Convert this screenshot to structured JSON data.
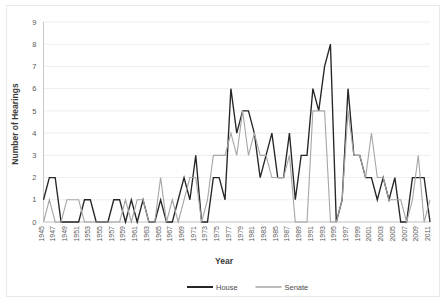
{
  "chart_data": {
    "type": "line",
    "title": "",
    "xlabel": "Year",
    "ylabel": "Number of Hearings",
    "ylim": [
      0,
      9
    ],
    "xlim": [
      1945,
      2011
    ],
    "grid": true,
    "legend_position": "bottom",
    "y_ticks": [
      "0",
      "1",
      "2",
      "3",
      "4",
      "5",
      "6",
      "7",
      "8",
      "9"
    ],
    "x_tick_labels": [
      "1945",
      "1947",
      "1949",
      "1951",
      "1953",
      "1955",
      "1957",
      "1959",
      "1961",
      "1963",
      "1965",
      "1967",
      "1969",
      "1971",
      "1973",
      "1975",
      "1977",
      "1979",
      "1981",
      "1983",
      "1985",
      "1987",
      "1989",
      "1991",
      "1993",
      "1995",
      "1997",
      "1999",
      "2001",
      "2003",
      "2005",
      "2007",
      "2009",
      "2011"
    ],
    "x": [
      1945,
      1946,
      1947,
      1948,
      1949,
      1950,
      1951,
      1952,
      1953,
      1954,
      1955,
      1956,
      1957,
      1958,
      1959,
      1960,
      1961,
      1962,
      1963,
      1964,
      1965,
      1966,
      1967,
      1968,
      1969,
      1970,
      1971,
      1972,
      1973,
      1974,
      1975,
      1976,
      1977,
      1978,
      1979,
      1980,
      1981,
      1982,
      1983,
      1984,
      1985,
      1986,
      1987,
      1988,
      1989,
      1990,
      1991,
      1992,
      1993,
      1994,
      1995,
      1996,
      1997,
      1998,
      1999,
      2000,
      2001,
      2002,
      2003,
      2004,
      2005,
      2006,
      2007,
      2008,
      2009,
      2010,
      2011
    ],
    "series": [
      {
        "name": "House",
        "color": "#262626",
        "values": [
          1,
          2,
          2,
          0,
          0,
          0,
          0,
          1,
          1,
          0,
          0,
          0,
          1,
          1,
          0,
          1,
          0,
          1,
          0,
          0,
          1,
          0,
          0,
          1,
          2,
          1,
          3,
          0,
          0,
          2,
          2,
          1,
          6,
          4,
          5,
          5,
          4,
          2,
          3,
          4,
          2,
          2,
          4,
          1,
          3,
          3,
          6,
          5,
          7,
          8,
          0,
          1,
          6,
          3,
          3,
          2,
          2,
          1,
          2,
          1,
          2,
          0,
          0,
          2,
          2,
          2,
          0
        ]
      },
      {
        "name": "Senate",
        "color": "#a6a6a6",
        "values": [
          0,
          1,
          0,
          0,
          1,
          1,
          1,
          0,
          0,
          0,
          0,
          0,
          0,
          0,
          1,
          0,
          1,
          1,
          0,
          0,
          2,
          0,
          1,
          0,
          1,
          2,
          2,
          0,
          1,
          3,
          3,
          3,
          4,
          3,
          5,
          3,
          4,
          3,
          3,
          2,
          2,
          2,
          3,
          0,
          0,
          0,
          5,
          5,
          5,
          0,
          0,
          1,
          5,
          3,
          3,
          2,
          4,
          2,
          2,
          1,
          1,
          1,
          0,
          1,
          3,
          0,
          1
        ]
      }
    ]
  },
  "legend": {
    "items": [
      {
        "label": "House",
        "color": "#262626"
      },
      {
        "label": "Senate",
        "color": "#a6a6a6"
      }
    ]
  }
}
